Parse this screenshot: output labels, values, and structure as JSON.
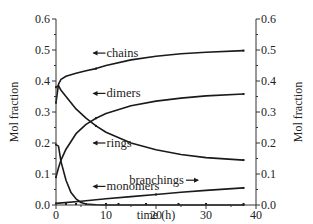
{
  "chart_data": {
    "type": "line",
    "title": "",
    "xlabel": "time (h)",
    "ylabel": "Mol fraction",
    "ylabel_right": "Mol fraction",
    "xlim": [
      0,
      40
    ],
    "ylim": [
      0.0,
      0.6
    ],
    "x_ticks": [
      "0",
      "10",
      "20",
      "30",
      "40"
    ],
    "y_ticks": [
      "0.0",
      "0.1",
      "0.2",
      "0.3",
      "0.4",
      "0.5",
      "0.6"
    ],
    "grid": false,
    "legend": "inline annotations with arrows",
    "series": [
      {
        "name": "chains",
        "x": [
          0,
          0.5,
          1,
          2,
          4,
          6,
          8,
          10,
          15,
          20,
          25,
          30,
          37.5
        ],
        "y": [
          0.33,
          0.39,
          0.405,
          0.415,
          0.425,
          0.433,
          0.44,
          0.45,
          0.468,
          0.48,
          0.488,
          0.493,
          0.498
        ],
        "markers_x": [
          4,
          8,
          18,
          24.5
        ],
        "annotation": "chains"
      },
      {
        "name": "dimers",
        "x": [
          0,
          0.5,
          1,
          2,
          4,
          6,
          8,
          10,
          15,
          20,
          25,
          30,
          37.5
        ],
        "y": [
          0.38,
          0.385,
          0.37,
          0.35,
          0.31,
          0.28,
          0.255,
          0.235,
          0.2,
          0.178,
          0.163,
          0.153,
          0.145
        ],
        "annotation": "dimers"
      },
      {
        "name": "rings",
        "x": [
          0,
          0.5,
          1,
          2,
          4,
          6,
          8,
          10,
          15,
          20,
          25,
          30,
          37.5
        ],
        "y": [
          0.09,
          0.12,
          0.145,
          0.18,
          0.23,
          0.26,
          0.28,
          0.295,
          0.32,
          0.335,
          0.345,
          0.352,
          0.358
        ],
        "annotation": "rings"
      },
      {
        "name": "monomers",
        "x": [
          0,
          0.5,
          1,
          2,
          3,
          4,
          5,
          6,
          8,
          10,
          15,
          20,
          25,
          30,
          37.5
        ],
        "y": [
          0.195,
          0.19,
          0.14,
          0.08,
          0.04,
          0.02,
          0.008,
          0.003,
          0.001,
          0.0,
          0.0,
          0.0,
          0.0,
          0.0,
          0.0
        ],
        "annotation": "monomers"
      },
      {
        "name": "branchings",
        "x": [
          0,
          5,
          10,
          15,
          20,
          25,
          30,
          37.5
        ],
        "y": [
          0.005,
          0.012,
          0.02,
          0.027,
          0.034,
          0.041,
          0.047,
          0.055
        ],
        "annotation": "branchings"
      }
    ],
    "annotations": [
      {
        "text": "chains",
        "arrow": "left",
        "x": 7.5,
        "y": 0.49
      },
      {
        "text": "dimers",
        "arrow": "left",
        "x": 7.5,
        "y": 0.36
      },
      {
        "text": "rings",
        "arrow": "left",
        "x": 7.5,
        "y": 0.2
      },
      {
        "text": "monomers",
        "arrow": "left",
        "x": 7.5,
        "y": 0.06
      },
      {
        "text": "branchings",
        "arrow": "right",
        "x": 26,
        "y": 0.08
      }
    ]
  }
}
